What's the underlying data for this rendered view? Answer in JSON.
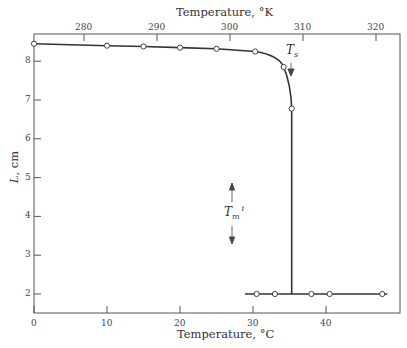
{
  "chart_data": {
    "type": "line",
    "title": "",
    "xlabel": "Temperature, °C",
    "xlabel_top": "Temperature, °K",
    "ylabel": "L, cm",
    "xlim": [
      0,
      49
    ],
    "ylim": [
      1.5,
      8.9
    ],
    "x_ticks": [
      0,
      10,
      20,
      30,
      40
    ],
    "x_top_ticks": [
      280,
      290,
      300,
      310,
      320
    ],
    "y_ticks": [
      2,
      3,
      4,
      5,
      6,
      7,
      8
    ],
    "grid": false,
    "series": [
      {
        "name": "heating curve",
        "points": [
          [
            0,
            8.45
          ],
          [
            10,
            8.4
          ],
          [
            15,
            8.38
          ],
          [
            20,
            8.35
          ],
          [
            25,
            8.32
          ],
          [
            30.3,
            8.25
          ],
          [
            34.2,
            7.85
          ],
          [
            35.3,
            6.78
          ]
        ]
      },
      {
        "name": "melted",
        "points": [
          [
            30.5,
            2.0
          ],
          [
            33,
            2.0
          ],
          [
            38,
            2.0
          ],
          [
            40.5,
            2.0
          ],
          [
            47.7,
            2.0
          ]
        ]
      }
    ],
    "transition_x": 35.3,
    "annotations": [
      {
        "text": "T_s",
        "x": 35.0,
        "y": 8.05,
        "arrow": "down"
      },
      {
        "text": "T_m^i",
        "x": 27,
        "y": 4.1,
        "arrow": "up-down"
      }
    ]
  },
  "labels": {
    "top_axis_title": "Temperature, °K",
    "bottom_axis_title": "Temperature, °C",
    "y_axis_title_var": "L",
    "y_axis_title_unit": ", cm",
    "ts_main": "T",
    "ts_sub": "s",
    "tm_main": "T",
    "tm_sub": "m",
    "tm_sup": "i",
    "x_ticks": [
      "0",
      "10",
      "20",
      "30",
      "40"
    ],
    "x_top_ticks": [
      "280",
      "290",
      "300",
      "310",
      "320"
    ],
    "y_ticks": [
      "2",
      "3",
      "4",
      "5",
      "6",
      "7",
      "8"
    ]
  }
}
